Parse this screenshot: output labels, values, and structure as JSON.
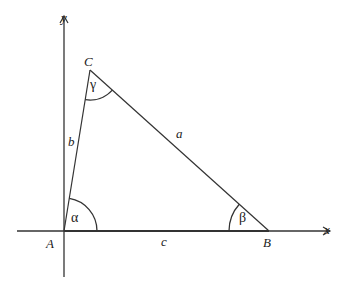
{
  "diagram": {
    "type": "triangle-on-axes",
    "colors": {
      "stroke": "#333333",
      "text": "#222222",
      "background": "#ffffff"
    },
    "axes": {
      "x_label": "x",
      "y_label": "y"
    },
    "vertices": {
      "A": {
        "label": "A"
      },
      "B": {
        "label": "B"
      },
      "C": {
        "label": "C"
      }
    },
    "sides": {
      "a": {
        "label": "a",
        "between": "B-C"
      },
      "b": {
        "label": "b",
        "between": "A-C"
      },
      "c": {
        "label": "c",
        "between": "A-B"
      }
    },
    "angles": {
      "alpha": {
        "label": "α",
        "at": "A"
      },
      "beta": {
        "label": "β",
        "at": "B"
      },
      "gamma": {
        "label": "γ",
        "at": "C"
      }
    }
  }
}
